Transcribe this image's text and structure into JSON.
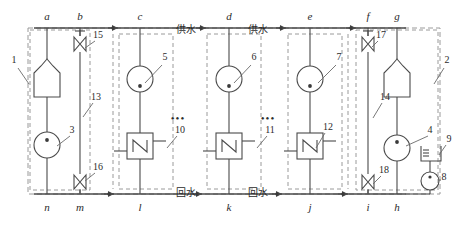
{
  "diagram": {
    "colors": {
      "line": "#4a4a4a",
      "dashed": "#9a9a9a",
      "text": "#2b2b2b",
      "background": "#ffffff"
    },
    "supply_header_label": "供水",
    "return_header_label": "回水",
    "supply_labels": [
      {
        "text": "供水",
        "x": 186,
        "y": 33
      },
      {
        "text": "供水",
        "x": 258,
        "y": 33
      }
    ],
    "return_labels": [
      {
        "text": "回水",
        "x": 186,
        "y": 196
      },
      {
        "text": "回水",
        "x": 258,
        "y": 196
      }
    ],
    "top_nodes": [
      {
        "letter": "a",
        "x": 47
      },
      {
        "letter": "b",
        "x": 80
      },
      {
        "letter": "c",
        "x": 140
      },
      {
        "letter": "d",
        "x": 229
      },
      {
        "letter": "e",
        "x": 310
      },
      {
        "letter": "f",
        "x": 368
      },
      {
        "letter": "g",
        "x": 397
      }
    ],
    "bottom_nodes": [
      {
        "letter": "n",
        "x": 47
      },
      {
        "letter": "m",
        "x": 80
      },
      {
        "letter": "l",
        "x": 140
      },
      {
        "letter": "k",
        "x": 229
      },
      {
        "letter": "j",
        "x": 310
      },
      {
        "letter": "i",
        "x": 368
      },
      {
        "letter": "h",
        "x": 397
      }
    ],
    "reference_numbers": [
      {
        "id": "1",
        "text": "1",
        "x": 14,
        "y": 63,
        "desc": "left-boiler-group-boundary"
      },
      {
        "id": "2",
        "text": "2",
        "x": 447,
        "y": 63,
        "desc": "right-boiler-group-boundary"
      },
      {
        "id": "3",
        "text": "3",
        "x": 72,
        "y": 133,
        "desc": "left-circulation-pump"
      },
      {
        "id": "4",
        "text": "4",
        "x": 430,
        "y": 133,
        "desc": "right-circulation-pump"
      },
      {
        "id": "5",
        "text": "5",
        "x": 165,
        "y": 60,
        "desc": "substation-pump-c"
      },
      {
        "id": "6",
        "text": "6",
        "x": 254,
        "y": 60,
        "desc": "substation-pump-d"
      },
      {
        "id": "7",
        "text": "7",
        "x": 339,
        "y": 60,
        "desc": "substation-pump-e"
      },
      {
        "id": "8",
        "text": "8",
        "x": 444,
        "y": 180,
        "desc": "make-up-water-pump"
      },
      {
        "id": "9",
        "text": "9",
        "x": 449,
        "y": 142,
        "desc": "expansion-tank"
      },
      {
        "id": "10",
        "text": "10",
        "x": 180,
        "y": 133,
        "desc": "heat-user-branch-10"
      },
      {
        "id": "11",
        "text": "11",
        "x": 270,
        "y": 133,
        "desc": "heat-user-branch-11"
      },
      {
        "id": "12",
        "text": "12",
        "x": 328,
        "y": 130,
        "desc": "heat-user-branch-12"
      },
      {
        "id": "13",
        "text": "13",
        "x": 96,
        "y": 100,
        "desc": "left-bypass-pipe"
      },
      {
        "id": "14",
        "text": "14",
        "x": 385,
        "y": 100,
        "desc": "right-boiler"
      },
      {
        "id": "15",
        "text": "15",
        "x": 98,
        "y": 38,
        "desc": "left-upper-valve"
      },
      {
        "id": "16",
        "text": "16",
        "x": 98,
        "y": 170,
        "desc": "left-lower-valve"
      },
      {
        "id": "17",
        "text": "17",
        "x": 381,
        "y": 38,
        "desc": "right-upper-valve"
      },
      {
        "id": "18",
        "text": "18",
        "x": 384,
        "y": 173,
        "desc": "right-lower-valve"
      }
    ],
    "ellipsis": [
      {
        "x": 178,
        "y": 122,
        "text": "•••"
      },
      {
        "x": 268,
        "y": 122,
        "text": "•••"
      }
    ],
    "components": {
      "boilers": [
        {
          "name": "left-boiler",
          "x": 47,
          "y": 75
        },
        {
          "name": "right-boiler",
          "x": 397,
          "y": 75
        }
      ],
      "pumps": [
        {
          "name": "left-circulation-pump",
          "x": 47,
          "y": 145
        },
        {
          "name": "pump-c",
          "x": 140,
          "y": 79
        },
        {
          "name": "pump-d",
          "x": 229,
          "y": 79
        },
        {
          "name": "pump-e",
          "x": 310,
          "y": 79
        },
        {
          "name": "right-circulation-pump",
          "x": 397,
          "y": 148
        },
        {
          "name": "make-up-pump",
          "x": 430,
          "y": 181
        }
      ],
      "radiators": [
        {
          "name": "radiator-l",
          "x": 140,
          "y": 146
        },
        {
          "name": "radiator-k",
          "x": 229,
          "y": 146
        },
        {
          "name": "radiator-j",
          "x": 310,
          "y": 146
        }
      ],
      "valves": [
        {
          "name": "valve-15",
          "x": 80,
          "y": 44
        },
        {
          "name": "valve-16",
          "x": 80,
          "y": 182
        },
        {
          "name": "valve-17",
          "x": 368,
          "y": 44
        },
        {
          "name": "valve-18",
          "x": 368,
          "y": 182
        }
      ],
      "expansion_tank": {
        "name": "expansion-tank",
        "x": 430,
        "y": 152
      }
    }
  }
}
